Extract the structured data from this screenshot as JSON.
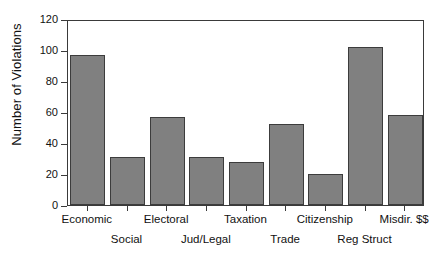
{
  "chart_data": {
    "type": "bar",
    "title": "",
    "subtitle": "",
    "xlabel": "",
    "ylabel": "Number of Violations",
    "categories": [
      "Economic",
      "Social",
      "Electoral",
      "Jud/Legal",
      "Taxation",
      "Trade",
      "Citizenship",
      "Reg Struct",
      "Misdir. $$"
    ],
    "values": [
      97,
      31,
      57,
      31,
      28,
      52,
      20,
      102,
      58
    ],
    "ylim": [
      0,
      120
    ],
    "yticks": [
      0,
      20,
      40,
      60,
      80,
      100,
      120
    ],
    "ytick_labels": [
      "0",
      "20",
      "40",
      "60",
      "80",
      "100",
      "120"
    ],
    "grid": false,
    "legend": null,
    "legend_position": "none",
    "bar_color": "#808080",
    "bar_edge_color": "#3c3c3c",
    "axis_color": "#3a3a3a",
    "background_color": "#ffffff",
    "label_rows": [
      "top",
      "bottom",
      "top",
      "bottom",
      "top",
      "bottom",
      "top",
      "bottom",
      "top"
    ]
  }
}
